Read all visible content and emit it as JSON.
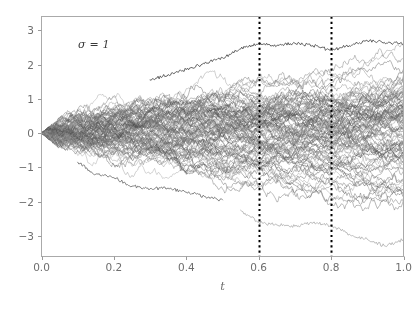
{
  "chart_data": {
    "type": "line",
    "title": "",
    "subtitle": "",
    "xlabel": "t",
    "ylabel": "",
    "xlim": [
      0.0,
      1.0
    ],
    "ylim": [
      -3.6,
      3.4
    ],
    "xticks": [
      0.0,
      0.2,
      0.4,
      0.6,
      0.8,
      1.0
    ],
    "xticklabels": [
      "0.0",
      "0.2",
      "0.4",
      "0.6",
      "0.8",
      "1.0"
    ],
    "yticks": [
      3,
      2,
      1,
      0,
      -1,
      -2,
      -3
    ],
    "yticklabels": [
      "3",
      "2",
      "1",
      "0",
      "−1",
      "−2",
      "−3"
    ],
    "grid": false,
    "legend": null,
    "annotations": [
      {
        "name": "sigma-label",
        "text": "σ = 1",
        "x": 0.095,
        "y": 2.45
      }
    ],
    "vlines": [
      {
        "x": 0.6,
        "style": "dotted",
        "color": "#000000",
        "width": 2.0
      },
      {
        "x": 0.8,
        "style": "dotted",
        "color": "#000000",
        "width": 2.0
      }
    ],
    "series_count": 100,
    "series_style": {
      "palette": "grayscale",
      "color_min": "#4a4a4a",
      "color_max": "#b4b4b4",
      "alpha": 0.55,
      "linewidth": 0.8
    },
    "paths_start": {
      "t": 0.0,
      "value": 0.0
    },
    "sigma": 1,
    "n_steps": 320,
    "envelope": {
      "model": "sigma*sqrt(t)",
      "t_samples": [
        0.0,
        0.1,
        0.2,
        0.3,
        0.4,
        0.5,
        0.6,
        0.7,
        0.8,
        0.9,
        1.0
      ],
      "upper_max": [
        0.0,
        0.95,
        1.4,
        1.7,
        1.95,
        2.15,
        2.45,
        2.6,
        2.7,
        3.0,
        3.15
      ],
      "lower_min": [
        0.0,
        -0.95,
        -1.4,
        -1.7,
        -1.95,
        -2.15,
        -2.35,
        -2.8,
        -2.85,
        -3.1,
        -3.35
      ],
      "upper_1sd": [
        0.0,
        0.32,
        0.45,
        0.55,
        0.63,
        0.71,
        0.77,
        0.84,
        0.89,
        0.95,
        1.0
      ],
      "lower_1sd": [
        0.0,
        -0.32,
        -0.45,
        -0.55,
        -0.63,
        -0.71,
        -0.77,
        -0.84,
        -0.89,
        -0.95,
        -1.0
      ]
    },
    "notable_paths": [
      {
        "name": "dark-upper-outlier",
        "color": "#4a4a4a",
        "t": [
          0.3,
          0.4,
          0.5,
          0.55,
          0.6,
          0.65,
          0.7,
          0.75,
          0.8,
          0.85,
          0.9,
          1.0
        ],
        "y": [
          1.55,
          1.85,
          2.2,
          2.45,
          2.62,
          2.55,
          2.62,
          2.55,
          2.42,
          2.55,
          2.7,
          2.6
        ]
      },
      {
        "name": "light-lower-outlier",
        "color": "#b0b0b0",
        "t": [
          0.55,
          0.6,
          0.65,
          0.7,
          0.75,
          0.8,
          0.85,
          0.9,
          0.95,
          1.0
        ],
        "y": [
          -2.25,
          -2.6,
          -2.68,
          -2.72,
          -2.62,
          -2.7,
          -2.95,
          -3.1,
          -3.3,
          -3.1
        ]
      },
      {
        "name": "mid-lower-outlier",
        "color": "#707070",
        "t": [
          0.1,
          0.15,
          0.2,
          0.25,
          0.3,
          0.35,
          0.4,
          0.45,
          0.5
        ],
        "y": [
          -0.85,
          -1.2,
          -1.3,
          -1.55,
          -1.62,
          -1.6,
          -1.72,
          -1.85,
          -1.95
        ]
      }
    ]
  },
  "axes": {
    "frame_color": "#aaaaaa",
    "tick_color": "#9a9a9a",
    "label_color": "#6e6e6e",
    "background": "#ffffff"
  }
}
